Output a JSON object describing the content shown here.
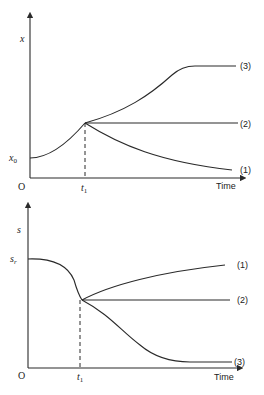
{
  "top_panel": {
    "y_label": "x",
    "initial_label": "x0",
    "origin_label": "O",
    "t_label": "t1",
    "x_axis_label": "Time",
    "curves": [
      {
        "id": "1",
        "label": "(1)",
        "description": "decays after t1"
      },
      {
        "id": "2",
        "label": "(2)",
        "description": "constant after t1"
      },
      {
        "id": "3",
        "label": "(3)",
        "description": "rises then plateaus after t1"
      }
    ]
  },
  "bottom_panel": {
    "y_label": "s",
    "initial_label": "sr",
    "origin_label": "O",
    "t_label": "t1",
    "x_axis_label": "Time",
    "curves": [
      {
        "id": "1",
        "label": "(1)",
        "description": "rises after t1"
      },
      {
        "id": "2",
        "label": "(2)",
        "description": "constant after t1"
      },
      {
        "id": "3",
        "label": "(3)",
        "description": "declines then plateaus after t1"
      }
    ]
  }
}
